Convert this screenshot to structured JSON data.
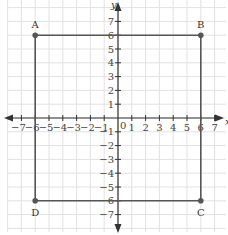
{
  "diagram": {
    "type": "coordinate-plane",
    "x_axis_label": "x",
    "y_axis_label": "y",
    "x_range": [
      -7,
      7
    ],
    "y_range": [
      -7,
      7
    ],
    "x_ticks": [
      "-7",
      "-6",
      "-5",
      "-4",
      "-3",
      "-2",
      "-1",
      "1",
      "2",
      "3",
      "4",
      "5",
      "6",
      "7"
    ],
    "y_ticks": [
      "7",
      "6",
      "5",
      "4",
      "3",
      "2",
      "1",
      "-1",
      "-2",
      "-3",
      "-4",
      "-5",
      "-6",
      "-7"
    ],
    "origin_label": "0",
    "points": [
      {
        "label": "A",
        "x": -6,
        "y": 6
      },
      {
        "label": "B",
        "x": 6,
        "y": 6
      },
      {
        "label": "C",
        "x": 6,
        "y": -6
      },
      {
        "label": "D",
        "x": -6,
        "y": -6
      }
    ],
    "shape": "square ABCD",
    "colors": {
      "grid": "#e2e2e2",
      "axis": "#333333",
      "shape": "#555555",
      "point": "#555555"
    }
  }
}
